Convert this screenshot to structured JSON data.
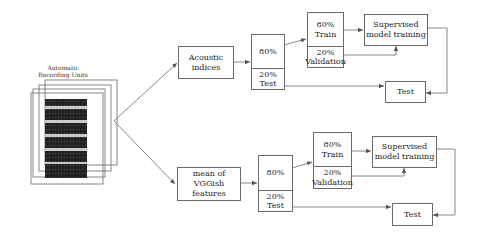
{
  "recorders": {
    "caption_line1": "Automatic",
    "caption_line2": "Recording Units"
  },
  "pipelines": [
    {
      "feature_line1": "Acoustic",
      "feature_line2": "indices",
      "split_top": "80%",
      "split_bottom_pct": "20%",
      "split_bottom_label": "Test",
      "train_pct": "80%",
      "train_label": "Train",
      "val_pct": "20%",
      "val_label": "Validation",
      "model_line1": "Supervised",
      "model_line2": "model training",
      "test_label": "Test"
    },
    {
      "feature_line1": "mean of",
      "feature_line2": "VGGish features",
      "split_top": "80%",
      "split_bottom_pct": "20%",
      "split_bottom_label": "Test",
      "train_pct": "80%",
      "train_label": "Train",
      "val_pct": "20%",
      "val_label": "Validation",
      "model_line1": "Supervised",
      "model_line2": "model training",
      "test_label": "Test"
    }
  ],
  "colors": {
    "line": "#6a6a6a",
    "waveform": "#1a1a1a"
  }
}
